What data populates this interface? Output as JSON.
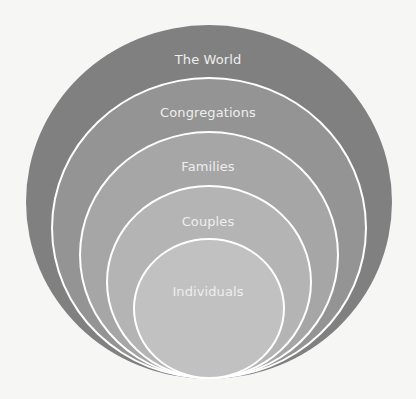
{
  "diagram": {
    "type": "nested-circles",
    "background": "#f6f6f4",
    "stroke_color": "#ffffff",
    "label_color": "#eeeeee",
    "layers": [
      {
        "label": "The World",
        "fill": "#808080"
      },
      {
        "label": "Congregations",
        "fill": "#949494"
      },
      {
        "label": "Families",
        "fill": "#a6a6a6"
      },
      {
        "label": "Couples",
        "fill": "#b4b4b4"
      },
      {
        "label": "Individuals",
        "fill": "#c1c1c1"
      }
    ]
  }
}
